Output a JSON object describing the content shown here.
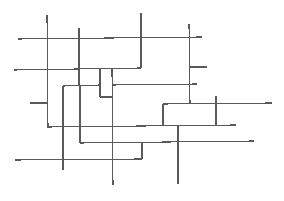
{
  "diagram": {
    "type": "line-segment-network",
    "width": 284,
    "height": 201,
    "stroke_color": "#5a5a5a",
    "background": "#ffffff",
    "segments": [
      {
        "id": "h1",
        "x1": 18,
        "y1": 39,
        "x2": 202,
        "y2": 37
      },
      {
        "id": "h2",
        "x1": 14,
        "y1": 70,
        "x2": 141,
        "y2": 68
      },
      {
        "id": "v1",
        "x1": 141,
        "y1": 13,
        "x2": 141,
        "y2": 68
      },
      {
        "id": "v2",
        "x1": 47,
        "y1": 15,
        "x2": 48,
        "y2": 128
      },
      {
        "id": "v3",
        "x1": 79,
        "y1": 28,
        "x2": 79,
        "y2": 86
      },
      {
        "id": "h3",
        "x1": 63,
        "y1": 86,
        "x2": 100,
        "y2": 85
      },
      {
        "id": "v4",
        "x1": 63,
        "y1": 86,
        "x2": 63,
        "y2": 170
      },
      {
        "id": "v5",
        "x1": 100,
        "y1": 69,
        "x2": 100,
        "y2": 97
      },
      {
        "id": "h4",
        "x1": 100,
        "y1": 97,
        "x2": 112,
        "y2": 97
      },
      {
        "id": "v6",
        "x1": 112,
        "y1": 69,
        "x2": 113,
        "y2": 185
      },
      {
        "id": "h5",
        "x1": 112,
        "y1": 85,
        "x2": 197,
        "y2": 84
      },
      {
        "id": "v7",
        "x1": 189,
        "y1": 24,
        "x2": 190,
        "y2": 103
      },
      {
        "id": "h6",
        "x1": 189,
        "y1": 67,
        "x2": 207,
        "y2": 67
      },
      {
        "id": "h7",
        "x1": 30,
        "y1": 103,
        "x2": 48,
        "y2": 103
      },
      {
        "id": "h8",
        "x1": 163,
        "y1": 104,
        "x2": 272,
        "y2": 103
      },
      {
        "id": "v8",
        "x1": 163,
        "y1": 104,
        "x2": 163,
        "y2": 126
      },
      {
        "id": "v9",
        "x1": 216,
        "y1": 96,
        "x2": 216,
        "y2": 125
      },
      {
        "id": "h9",
        "x1": 48,
        "y1": 127,
        "x2": 236,
        "y2": 125
      },
      {
        "id": "v10",
        "x1": 178,
        "y1": 126,
        "x2": 178,
        "y2": 184
      },
      {
        "id": "v11",
        "x1": 80,
        "y1": 86,
        "x2": 80,
        "y2": 143
      },
      {
        "id": "h10",
        "x1": 80,
        "y1": 143,
        "x2": 254,
        "y2": 141
      },
      {
        "id": "v12",
        "x1": 142,
        "y1": 142,
        "x2": 142,
        "y2": 159
      },
      {
        "id": "h11",
        "x1": 15,
        "y1": 160,
        "x2": 142,
        "y2": 159
      }
    ]
  }
}
